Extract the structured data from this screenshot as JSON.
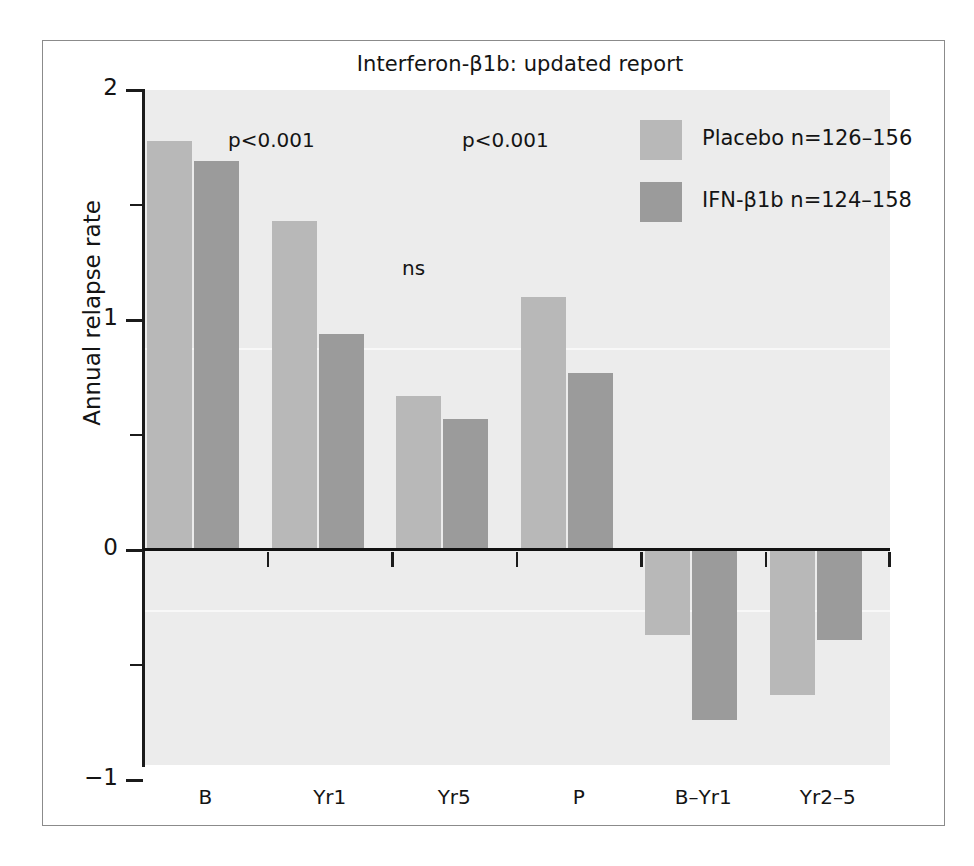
{
  "chart_data": {
    "type": "bar",
    "title": "Interferon-β1b: updated report",
    "xlabel": "",
    "ylabel": "Annual relapse rate",
    "ylim": [
      -1,
      2
    ],
    "grid": false,
    "legend_position": "top-right",
    "categories": [
      "B",
      "Yr1",
      "Yr5",
      "P",
      "B–Yr1",
      "Yr2–5"
    ],
    "series": [
      {
        "name": "Placebo n=126–156",
        "short_name": "Placebo",
        "color": "#b8b8b8",
        "values": [
          1.78,
          1.43,
          0.67,
          1.1,
          -0.37,
          -0.63
        ]
      },
      {
        "name": "IFN-β1b n=124–158",
        "short_name": "IFN-β1b",
        "color": "#9b9b9b",
        "values": [
          1.69,
          0.94,
          0.57,
          0.77,
          -0.74,
          -0.39
        ]
      }
    ],
    "y_ticks_major": [
      2,
      1,
      0,
      -1
    ],
    "y_tick_labels": [
      "2",
      "1",
      "0",
      "−1"
    ],
    "y_ticks_minor": [
      1.5,
      0.5,
      -0.5
    ],
    "annotations": [
      {
        "text": "p<0.001",
        "x": 0.3,
        "y": 1.63
      },
      {
        "text": "p<0.001",
        "x": 0.55,
        "y": 1.63
      },
      {
        "text": "ns",
        "x": 0.44,
        "y": 1.24
      }
    ]
  },
  "legend": {
    "items": [
      {
        "label": "Placebo n=126–156"
      },
      {
        "label": "IFN-β1b n=124–158"
      }
    ]
  },
  "axis": {
    "y_title": "Annual relapse rate",
    "y_labels": [
      "2",
      "1",
      "0",
      "−1"
    ],
    "x_labels": [
      "B",
      "Yr1",
      "Yr5",
      "P",
      "B–Yr1",
      "Yr2–5"
    ]
  },
  "annotations": {
    "p1": "p<0.001",
    "p2": "p<0.001",
    "ns": "ns"
  },
  "title": "Interferon-β1b: updated report"
}
